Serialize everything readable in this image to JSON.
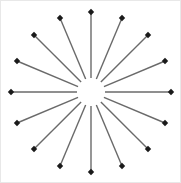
{
  "figure": {
    "background_color": "#ffffff",
    "border_color": "#e8e8e8",
    "width": 181,
    "height": 183
  },
  "chart_data": {
    "type": "scatter",
    "subtitle": "",
    "xlabel": "",
    "ylabel": "",
    "grid": false,
    "legend_position": "none",
    "axis_visible": false,
    "tick_labels": [],
    "annotations": [],
    "center": {
      "x": 90,
      "y": 91
    },
    "inner_gap_radius": 14,
    "outer_radius": 80,
    "ray_count": 16,
    "angle_step_degrees": 22.5,
    "start_angle_degrees": -90,
    "shaft_color": "#6a6a6a",
    "shaft_width": 1.4,
    "tip_color": "#1a1a1a",
    "tip_size": 3.2,
    "tip_shape": "diamond",
    "rays": [
      {
        "index": 0,
        "angle_deg": -90,
        "label": "N",
        "tip_x": 90,
        "tip_y": 11
      },
      {
        "index": 1,
        "angle_deg": -67.5,
        "label": "NNE",
        "tip_x": 121,
        "tip_y": 17
      },
      {
        "index": 2,
        "angle_deg": -45,
        "label": "NE",
        "tip_x": 147,
        "tip_y": 34
      },
      {
        "index": 3,
        "angle_deg": -22.5,
        "label": "ENE",
        "tip_x": 164,
        "tip_y": 60
      },
      {
        "index": 4,
        "angle_deg": 0,
        "label": "E",
        "tip_x": 170,
        "tip_y": 91
      },
      {
        "index": 5,
        "angle_deg": 22.5,
        "label": "ESE",
        "tip_x": 164,
        "tip_y": 122
      },
      {
        "index": 6,
        "angle_deg": 45,
        "label": "SE",
        "tip_x": 147,
        "tip_y": 148
      },
      {
        "index": 7,
        "angle_deg": 67.5,
        "label": "SSE",
        "tip_x": 121,
        "tip_y": 165
      },
      {
        "index": 8,
        "angle_deg": 90,
        "label": "S",
        "tip_x": 90,
        "tip_y": 171
      },
      {
        "index": 9,
        "angle_deg": 112.5,
        "label": "SSW",
        "tip_x": 59,
        "tip_y": 165
      },
      {
        "index": 10,
        "angle_deg": 135,
        "label": "SW",
        "tip_x": 33,
        "tip_y": 148
      },
      {
        "index": 11,
        "angle_deg": 157.5,
        "label": "WSW",
        "tip_x": 16,
        "tip_y": 122
      },
      {
        "index": 12,
        "angle_deg": 180,
        "label": "W",
        "tip_x": 10,
        "tip_y": 91
      },
      {
        "index": 13,
        "angle_deg": 202.5,
        "label": "WNW",
        "tip_x": 16,
        "tip_y": 60
      },
      {
        "index": 14,
        "angle_deg": 225,
        "label": "NW",
        "tip_x": 33,
        "tip_y": 34
      },
      {
        "index": 15,
        "angle_deg": 247.5,
        "label": "NNW",
        "tip_x": 59,
        "tip_y": 17
      }
    ]
  }
}
